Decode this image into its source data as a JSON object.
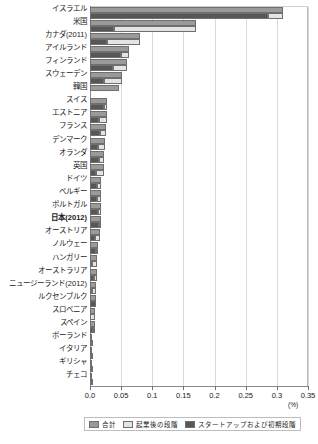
{
  "chart_data": {
    "type": "bar",
    "orientation": "horizontal",
    "stacked": true,
    "title": "",
    "xlabel": "(%)",
    "ylabel": "",
    "xlim": [
      0.0,
      0.35
    ],
    "xticks": [
      "0.0",
      "0.05",
      "0.1",
      "0.15",
      "0.2",
      "0.25",
      "0.3",
      "0.35"
    ],
    "xtick_values": [
      0.0,
      0.05,
      0.1,
      0.15,
      0.2,
      0.25,
      0.3,
      0.35
    ],
    "grid": true,
    "legend_position": "bottom",
    "unit": "(%)",
    "series": [
      {
        "name": "合計",
        "key": "total",
        "color": "#9a9a9a"
      },
      {
        "name": "起業後の段階",
        "key": "late",
        "color": "#e4e4e4"
      },
      {
        "name": "スタートアップおよび初期段階",
        "key": "early",
        "color": "#575757"
      }
    ],
    "categories": [
      "イスラエル",
      "米国",
      "カナダ(2011)",
      "アイルランド",
      "フィンランド",
      "スウェーデン",
      "韓国",
      "スイス",
      "エストニア",
      "フランス",
      "デンマーク",
      "オランダ",
      "英国",
      "ドイツ",
      "ベルギー",
      "ポルトガル",
      "日本(2012)",
      "オーストリア",
      "ノルウェー",
      "ハンガリー",
      "オーストラリア",
      "ニュージーランド(2012)",
      "ルクセンブルク",
      "スロベニア",
      "スペイン",
      "ポーランド",
      "イタリア",
      "ギリシャ",
      "チェコ"
    ],
    "rows": [
      {
        "label": "イスラエル",
        "bold": false,
        "total": 0.31,
        "early": 0.285,
        "late": 0.025
      },
      {
        "label": "米国",
        "bold": false,
        "total": 0.17,
        "early": 0.038,
        "late": 0.132
      },
      {
        "label": "カナダ(2011)",
        "bold": false,
        "total": 0.08,
        "early": 0.028,
        "late": 0.052
      },
      {
        "label": "アイルランド",
        "bold": false,
        "total": 0.063,
        "early": 0.05,
        "late": 0.013
      },
      {
        "label": "フィンランド",
        "bold": false,
        "total": 0.059,
        "early": 0.037,
        "late": 0.022
      },
      {
        "label": "スウェーデン",
        "bold": false,
        "total": 0.052,
        "early": 0.023,
        "late": 0.029
      },
      {
        "label": "韓国",
        "bold": false,
        "total": 0.047,
        "early": 0.0,
        "late": 0.0
      },
      {
        "label": "スイス",
        "bold": false,
        "total": 0.028,
        "early": 0.022,
        "late": 0.006
      },
      {
        "label": "エストニア",
        "bold": false,
        "total": 0.027,
        "early": 0.015,
        "late": 0.012
      },
      {
        "label": "フランス",
        "bold": false,
        "total": 0.025,
        "early": 0.016,
        "late": 0.009
      },
      {
        "label": "デンマーク",
        "bold": false,
        "total": 0.024,
        "early": 0.013,
        "late": 0.011
      },
      {
        "label": "オランダ",
        "bold": false,
        "total": 0.023,
        "early": 0.014,
        "late": 0.009
      },
      {
        "label": "英国",
        "bold": false,
        "total": 0.022,
        "early": 0.01,
        "late": 0.012
      },
      {
        "label": "ドイツ",
        "bold": false,
        "total": 0.018,
        "early": 0.012,
        "late": 0.006
      },
      {
        "label": "ベルギー",
        "bold": false,
        "total": 0.018,
        "early": 0.011,
        "late": 0.007
      },
      {
        "label": "ポルトガル",
        "bold": false,
        "total": 0.017,
        "early": 0.013,
        "late": 0.004
      },
      {
        "label": "日本(2012)",
        "bold": true,
        "total": 0.017,
        "early": 0.014,
        "late": 0.003
      },
      {
        "label": "オーストリア",
        "bold": false,
        "total": 0.016,
        "early": 0.008,
        "late": 0.008
      },
      {
        "label": "ノルウェー",
        "bold": false,
        "total": 0.013,
        "early": 0.009,
        "late": 0.004
      },
      {
        "label": "ハンガリー",
        "bold": false,
        "total": 0.012,
        "early": 0.004,
        "late": 0.008
      },
      {
        "label": "オーストラリア",
        "bold": false,
        "total": 0.011,
        "early": 0.007,
        "late": 0.004
      },
      {
        "label": "ニュージーランド(2012)",
        "bold": false,
        "total": 0.01,
        "early": 0.004,
        "late": 0.006
      },
      {
        "label": "ルクセンブルク",
        "bold": false,
        "total": 0.01,
        "early": 0.01,
        "late": 0.0
      },
      {
        "label": "スロベニア",
        "bold": false,
        "total": 0.008,
        "early": 0.0,
        "late": 0.008
      },
      {
        "label": "スペイン",
        "bold": false,
        "total": 0.008,
        "early": 0.005,
        "late": 0.003
      },
      {
        "label": "ポーランド",
        "bold": false,
        "total": 0.003,
        "early": 0.002,
        "late": 0.001
      },
      {
        "label": "イタリア",
        "bold": false,
        "total": 0.003,
        "early": 0.002,
        "late": 0.001
      },
      {
        "label": "ギリシャ",
        "bold": false,
        "total": 0.002,
        "early": 0.001,
        "late": 0.001
      },
      {
        "label": "チェコ",
        "bold": false,
        "total": 0.002,
        "early": 0.001,
        "late": 0.001
      }
    ]
  },
  "legend": {
    "items": [
      {
        "label": "合計",
        "color": "#9a9a9a"
      },
      {
        "label": "起業後の段階",
        "color": "#e4e4e4"
      },
      {
        "label": "スタートアップおよび初期段階",
        "color": "#575757"
      }
    ]
  },
  "axis": {
    "unit": "(%)",
    "ticks": [
      "0.0",
      "0.05",
      "0.1",
      "0.15",
      "0.2",
      "0.25",
      "0.3",
      "0.35"
    ]
  }
}
